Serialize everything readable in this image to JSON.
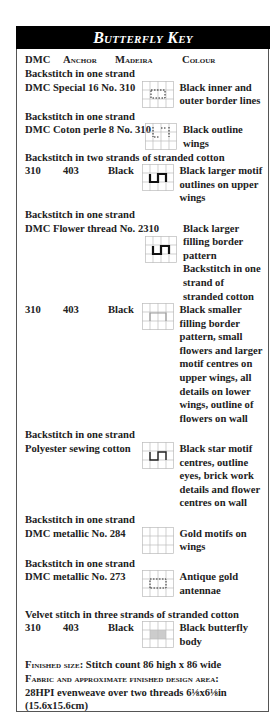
{
  "title": "Butterfly Key",
  "columns": {
    "dmc": "DMC",
    "anchor": "Anchor",
    "madeira": "Madeira",
    "colour": "Colour"
  },
  "entries": [
    {
      "section": "Backstitch in one strand",
      "thread": "DMC Special 16 No. 310",
      "symbol": "dotted-square-icon",
      "colour": "Black inner and outer border lines"
    },
    {
      "section": "Backstitch in one strand",
      "thread": "DMC Coton perle 8 No. 310",
      "symbol": "dotted-lines-icon",
      "colour": "Black outline wings"
    },
    {
      "section": "Backstitch in two strands of stranded cotton",
      "dmc": "310",
      "anchor": "403",
      "madeira": "Black",
      "symbol": "bold-step-icon",
      "colour": "Black larger motif outlines on upper wings"
    },
    {
      "section": "Backstitch in one strand",
      "thread": "DMC Flower thread No. 2310",
      "symbol": "bold-step-icon",
      "colour": "Black larger filling border pattern Backstitch in one strand of stranded cotton"
    },
    {
      "section": "",
      "dmc": "310",
      "anchor": "403",
      "madeira": "Black",
      "symbol": "thin-square-icon",
      "colour": "Black smaller filling border pattern, small flowers and larger motif centres on upper wings, all details on lower wings, outline of flowers on wall"
    },
    {
      "section": "Backstitch in one strand",
      "thread": "Polyester sewing cotton",
      "symbol": "step-icon",
      "colour": "Black star motif centres, outline eyes, brick work details and flower centres on wall"
    },
    {
      "section": "Backstitch in one strand",
      "thread": "DMC metallic No. 284",
      "symbol": "empty-grid-icon",
      "colour": "Gold motifs on wings"
    },
    {
      "section": "Backstitch in one strand",
      "thread": "DMC metallic No. 273",
      "symbol": "dotted-square-icon",
      "colour": "Antique gold antennae"
    },
    {
      "section": "Velvet stitch in three strands of stranded cotton",
      "dmc": "310",
      "anchor": "403",
      "madeira": "Black",
      "symbol": "shaded-cells-icon",
      "colour": "Black butterfly body"
    }
  ],
  "footer": {
    "finished_size_label": "Finished size:",
    "finished_size_value": "Stitch count 86 high x 86 wide",
    "fabric_label": "Fabric and approximate finished design area:",
    "fabric_value": "28HPI evenweave over two threads 6⅛x6⅛in (15.6x15.6cm)"
  }
}
